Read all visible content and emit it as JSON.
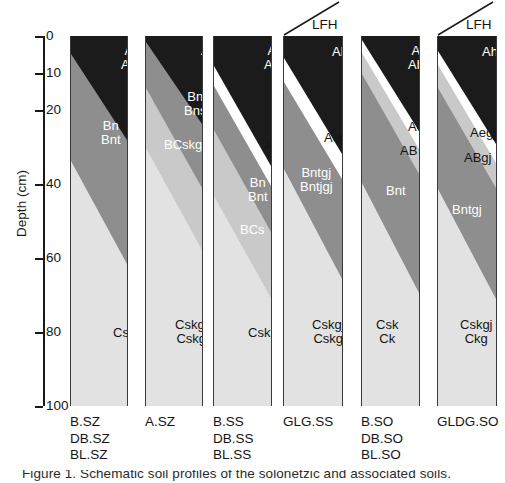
{
  "figure": {
    "width": 505,
    "height": 483,
    "caption_partial": "Figure 1. Schematic soil profiles of the solonetzic and associated soils."
  },
  "axis": {
    "title": "Depth (cm)",
    "unit": "cm",
    "min": 0,
    "max": 100,
    "ticks": [
      {
        "value": 0,
        "label": "0",
        "y": 36
      },
      {
        "value": 10,
        "label": "10",
        "y": 73
      },
      {
        "value": 20,
        "label": "20",
        "y": 110
      },
      {
        "value": 40,
        "label": "40",
        "y": 184
      },
      {
        "value": 60,
        "label": "60",
        "y": 258
      },
      {
        "value": 80,
        "label": "80",
        "y": 332
      },
      {
        "value": 100,
        "label": "100",
        "y": 406
      }
    ]
  },
  "palette": {
    "ah_dark": "#1b1b1b",
    "b_mid": "#8e8e8e",
    "bc_light": "#c9c9c9",
    "c_lightest": "#e2e2e2",
    "ae_white": "#ffffff",
    "outline": "#3a3a3a",
    "text_dark": "#141414",
    "text_light": "#ffffff"
  },
  "columns": [
    {
      "id": "col-1",
      "site_labels": [
        "B.SZ",
        "DB.SZ",
        "BL.SZ"
      ],
      "lfh": null,
      "horizons": [
        {
          "name": "Ah / Ahe",
          "lines": [
            "Ah",
            "Ahe"
          ],
          "color_key": "ah_dark",
          "text_color": "light",
          "label_x": 50,
          "label_y": 8
        },
        {
          "name": "Bn / Bnt",
          "lines": [
            "Bn",
            "Bnt"
          ],
          "color_key": "b_mid",
          "text_color": "light",
          "label_x": 30,
          "label_y": 83
        },
        {
          "name": "Csk",
          "lines": [
            "Csk"
          ],
          "color_key": "c_lightest",
          "text_color": "dark",
          "label_x": 42,
          "label_y": 290
        }
      ]
    },
    {
      "id": "col-2",
      "site_labels": [
        "A.SZ"
      ],
      "lfh": null,
      "horizons": [
        {
          "name": "Ah",
          "lines": [
            "Ah"
          ],
          "color_key": "ah_dark",
          "text_color": "light",
          "label_x": 55,
          "label_y": 8
        },
        {
          "name": "Bn / Bns",
          "lines": [
            "Bn",
            "Bns"
          ],
          "color_key": "b_mid",
          "text_color": "light",
          "label_x": 38,
          "label_y": 54
        },
        {
          "name": "BCskgj",
          "lines": [
            "BCskgj"
          ],
          "color_key": "bc_light",
          "text_color": "light",
          "label_x": 18,
          "label_y": 102
        },
        {
          "name": "Cskgj / Cskg",
          "lines": [
            "Cskgj",
            "Cskg"
          ],
          "color_key": "c_lightest",
          "text_color": "dark",
          "label_x": 29,
          "label_y": 282
        }
      ]
    },
    {
      "id": "col-3",
      "site_labels": [
        "B.SS",
        "DB.SS",
        "BL.SS"
      ],
      "lfh": null,
      "horizons": [
        {
          "name": "Ah / Ahe",
          "lines": [
            "Ah",
            "Ahe"
          ],
          "color_key": "ah_dark",
          "text_color": "light",
          "label_x": 50,
          "label_y": 8
        },
        {
          "name": "Ae",
          "lines": [
            "Ae"
          ],
          "color_key": "ae_white",
          "text_color": "dark",
          "label_x": 50,
          "label_y": 103
        },
        {
          "name": "Bn / Bnt",
          "lines": [
            "Bn",
            "Bnt"
          ],
          "color_key": "b_mid",
          "text_color": "light",
          "label_x": 34,
          "label_y": 140
        },
        {
          "name": "BCs",
          "lines": [
            "BCs"
          ],
          "color_key": "bc_light",
          "text_color": "light",
          "label_x": 26,
          "label_y": 187
        },
        {
          "name": "Csk",
          "lines": [
            "Csk"
          ],
          "color_key": "c_lightest",
          "text_color": "dark",
          "label_x": 34,
          "label_y": 290
        }
      ]
    },
    {
      "id": "col-4",
      "site_labels": [
        "GLG.SS"
      ],
      "lfh": {
        "label": "LFH"
      },
      "horizons": [
        {
          "name": "Ah",
          "lines": [
            "Ah"
          ],
          "color_key": "ah_dark",
          "text_color": "light",
          "label_x": 48,
          "label_y": 9
        },
        {
          "name": "Aegj",
          "lines": [
            "Aegj"
          ],
          "color_key": "ae_white",
          "text_color": "dark",
          "label_x": 40,
          "label_y": 95
        },
        {
          "name": "Bntgj / Bntjgj",
          "lines": [
            "Bntgj",
            "Bntjgj"
          ],
          "color_key": "b_mid",
          "text_color": "light",
          "label_x": 16,
          "label_y": 130
        },
        {
          "name": "Cskgj / Cskg",
          "lines": [
            "Cskgj",
            "Cskg"
          ],
          "color_key": "c_lightest",
          "text_color": "dark",
          "label_x": 28,
          "label_y": 282
        }
      ]
    },
    {
      "id": "col-5",
      "site_labels": [
        "B.SO",
        "DB.SO",
        "BL.SO"
      ],
      "lfh": null,
      "horizons": [
        {
          "name": "Ah / Ahe",
          "lines": [
            "Ah",
            "Ahe"
          ],
          "color_key": "ah_dark",
          "text_color": "light",
          "label_x": 46,
          "label_y": 8
        },
        {
          "name": "Ae",
          "lines": [
            "Ae"
          ],
          "color_key": "ae_white",
          "text_color": "dark",
          "label_x": 46,
          "label_y": 84
        },
        {
          "name": "AB",
          "lines": [
            "AB"
          ],
          "color_key": "bc_light",
          "text_color": "dark",
          "label_x": 38,
          "label_y": 108
        },
        {
          "name": "Bnt",
          "lines": [
            "Bnt"
          ],
          "color_key": "b_mid",
          "text_color": "light",
          "label_x": 24,
          "label_y": 148
        },
        {
          "name": "Csk / Ck",
          "lines": [
            "Csk",
            "Ck"
          ],
          "color_key": "c_lightest",
          "text_color": "dark",
          "label_x": 14,
          "label_y": 282
        }
      ]
    },
    {
      "id": "col-6",
      "site_labels": [
        "GLDG.SO"
      ],
      "lfh": {
        "label": "LFH"
      },
      "horizons": [
        {
          "name": "Ah",
          "lines": [
            "Ah"
          ],
          "color_key": "ah_dark",
          "text_color": "light",
          "label_x": 44,
          "label_y": 9
        },
        {
          "name": "Aegj",
          "lines": [
            "Aegj"
          ],
          "color_key": "ae_white",
          "text_color": "dark",
          "label_x": 32,
          "label_y": 90
        },
        {
          "name": "ABgj",
          "lines": [
            "ABgj"
          ],
          "color_key": "bc_light",
          "text_color": "dark",
          "label_x": 26,
          "label_y": 115
        },
        {
          "name": "Bntgj",
          "lines": [
            "Bntgj"
          ],
          "color_key": "b_mid",
          "text_color": "light",
          "label_x": 14,
          "label_y": 167
        },
        {
          "name": "Cskgj / Ckg",
          "lines": [
            "Cskgj",
            "Ckg"
          ],
          "color_key": "c_lightest",
          "text_color": "dark",
          "label_x": 22,
          "label_y": 282
        }
      ]
    }
  ],
  "geometry": {
    "col_x": [
      70,
      145,
      213,
      283,
      361,
      437
    ],
    "col_w": [
      58,
      58,
      59,
      60,
      59,
      60
    ],
    "top_y": 36,
    "height": 370,
    "label_x": [
      70,
      145,
      213,
      283,
      361,
      437
    ]
  }
}
